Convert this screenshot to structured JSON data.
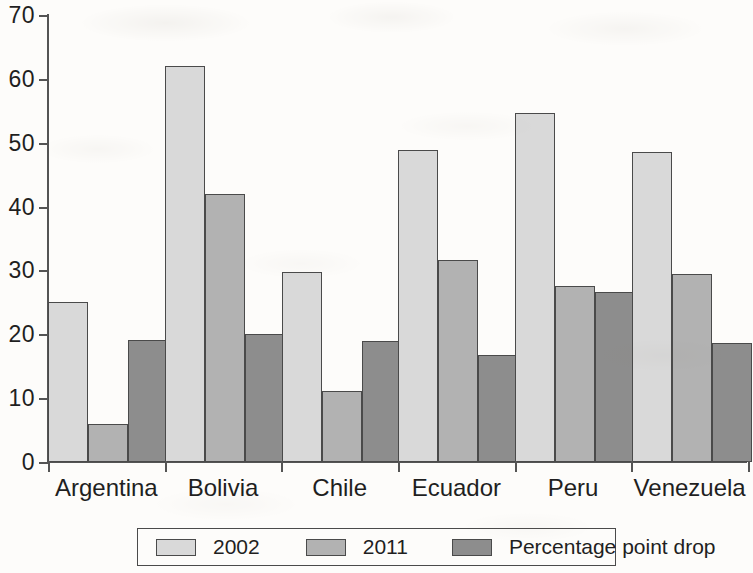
{
  "chart_data": {
    "type": "bar",
    "title": "",
    "xlabel": "",
    "ylabel": "",
    "ylim": [
      0,
      70
    ],
    "yticks": [
      0,
      10,
      20,
      30,
      40,
      50,
      60,
      70
    ],
    "ytick_labels": [
      "0",
      "10",
      "20",
      "30",
      "40",
      "50",
      "60",
      "70"
    ],
    "grid": false,
    "legend_position": "bottom",
    "categories": [
      "Argentina",
      "Bolivia",
      "Chile",
      "Ecuador",
      "Peru",
      "Venezuela"
    ],
    "series": [
      {
        "name": "2002",
        "color": "#d9d9d9",
        "values": [
          25.1,
          62.0,
          29.8,
          48.8,
          54.6,
          48.5
        ]
      },
      {
        "name": "2011",
        "color": "#b2b2b2",
        "values": [
          5.9,
          41.9,
          11.1,
          31.7,
          27.5,
          29.5
        ]
      },
      {
        "name": "Percentage point drop",
        "color": "#8d8d8d",
        "values": [
          19.1,
          20.0,
          18.9,
          16.8,
          26.6,
          18.6
        ]
      }
    ]
  },
  "legend": {
    "items": [
      {
        "label": "2002"
      },
      {
        "label": "2011"
      },
      {
        "label": "Percentage point drop"
      }
    ]
  }
}
